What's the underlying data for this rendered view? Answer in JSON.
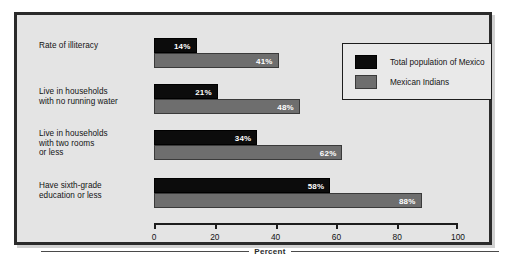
{
  "chart_data": {
    "type": "bar",
    "orientation": "horizontal",
    "title": "",
    "xlabel": "Percent",
    "ylabel": "",
    "xlim": [
      0,
      100
    ],
    "xticks": [
      "0",
      "20",
      "40",
      "60",
      "80",
      "100"
    ],
    "grid": false,
    "legend_position": "top-right",
    "categories": [
      "Rate of illiteracy",
      "Live in households with no running water",
      "Live in households with two rooms or less",
      "Have sixth-grade education or less"
    ],
    "category_lines": [
      [
        "Rate of illiteracy"
      ],
      [
        "Live in households",
        "with no running water"
      ],
      [
        "Live in households",
        "with two rooms",
        "or less"
      ],
      [
        "Have sixth-grade",
        "education or less"
      ]
    ],
    "series": [
      {
        "name": "Total population of Mexico",
        "color": "#0c0c0c",
        "values": [
          14,
          21,
          34,
          58
        ],
        "labels": [
          "14%",
          "21%",
          "34%",
          "58%"
        ]
      },
      {
        "name": "Mexican Indians",
        "color": "#6e6e6e",
        "values": [
          41,
          48,
          62,
          88
        ],
        "labels": [
          "41%",
          "48%",
          "62%",
          "88%"
        ]
      }
    ]
  },
  "legend": {
    "entries": [
      {
        "label": "Total population of Mexico",
        "swatch": "dark"
      },
      {
        "label": "Mexican Indians",
        "swatch": "gray"
      }
    ]
  },
  "axis": {
    "caption": "Percent",
    "ticks": [
      {
        "label": "0",
        "value": 0
      },
      {
        "label": "20",
        "value": 20
      },
      {
        "label": "40",
        "value": 40
      },
      {
        "label": "60",
        "value": 60
      },
      {
        "label": "80",
        "value": 80
      },
      {
        "label": "100",
        "value": 100
      }
    ]
  },
  "colors": {
    "background": "#e4e4e4",
    "page": "#ffffff",
    "frame": "#2b2b2b",
    "series_dark": "#0c0c0c",
    "series_gray": "#6e6e6e",
    "text": "#131313"
  }
}
